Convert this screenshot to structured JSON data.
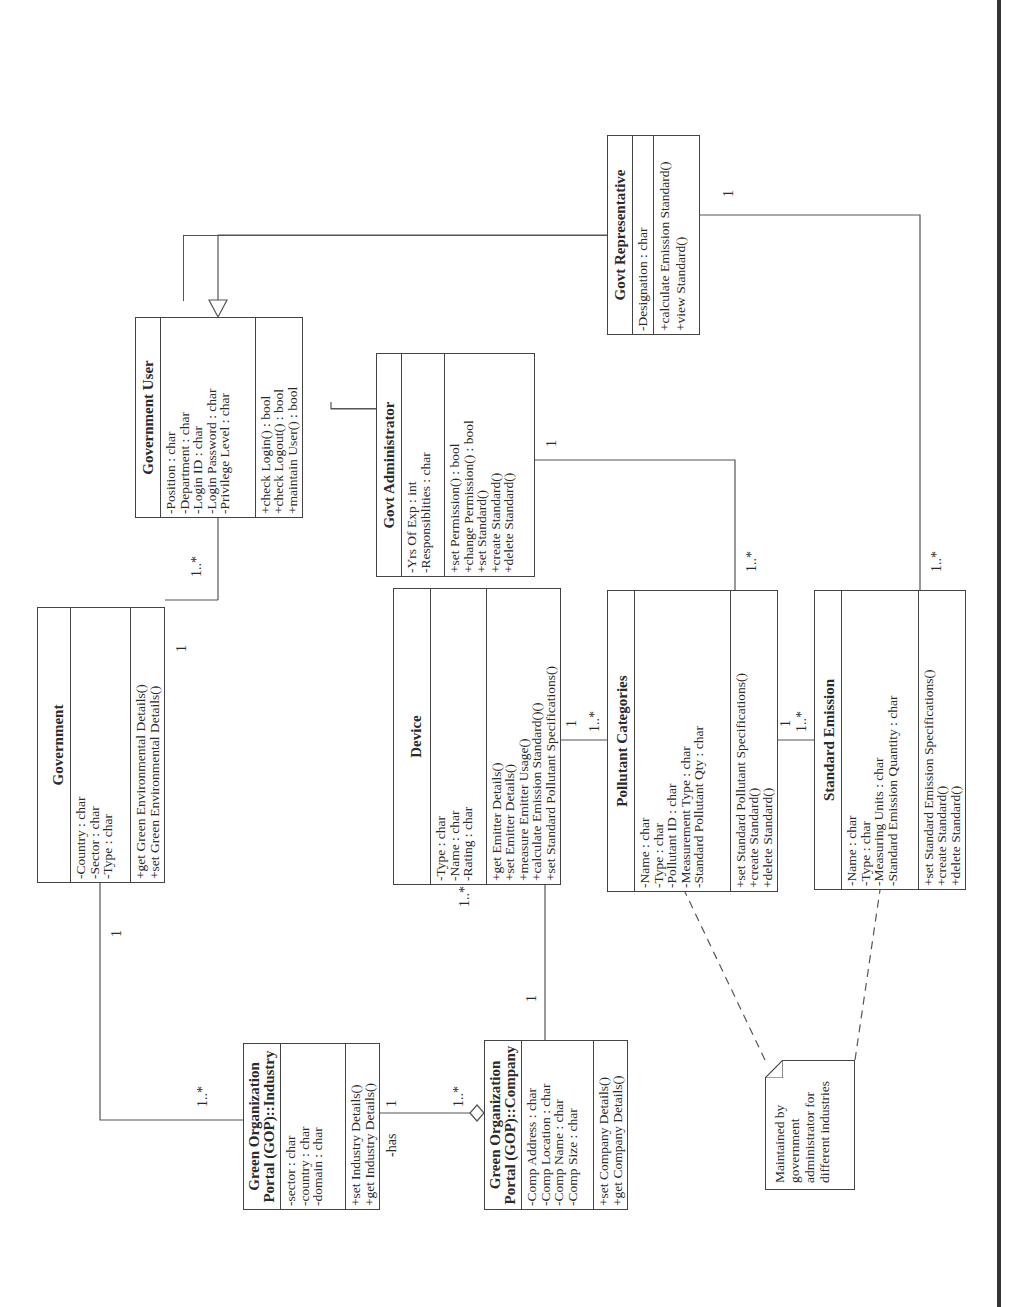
{
  "diagram_type": "UML class diagram",
  "orientation": "rotated 90 degrees counter-clockwise",
  "classes": {
    "government_user": {
      "name": "Government User",
      "attributes": [
        "-Position : char",
        "-Department : char",
        "-Login ID : char",
        "-Login Password : char",
        "-Privilege Level : char"
      ],
      "operations": [
        "+check Login() : bool",
        "+check Logout() : bool",
        "+maintain User() : bool"
      ]
    },
    "govt_administrator": {
      "name": "Govt Administrator",
      "attributes": [
        "-Yrs Of Exp : int",
        "-Responsiblities : char"
      ],
      "operations": [
        "+set Permission() : bool",
        "+change Permission() : bool",
        "+set Standard()",
        "+create Standard()",
        "+delete Standard()"
      ]
    },
    "govt_representative": {
      "name": "Govt Representative",
      "attributes": [
        "-Designation : char"
      ],
      "operations": [
        "+calculate Emission Standard()",
        "+view Standard()"
      ]
    },
    "government": {
      "name": "Government",
      "attributes": [
        "-Country : char",
        "-Sector : char",
        "-Type : char"
      ],
      "operations": [
        "+get Green Environmental Details()",
        "+set Green Environmental Details()"
      ]
    },
    "device": {
      "name": "Device",
      "attributes": [
        "-Type : char",
        "-Name : char",
        "-Rating : char"
      ],
      "operations": [
        "+get Emitter Details()",
        "+set Emitter Details()",
        "+measure Emitter Usage()",
        "+calculate Emission Standard()()",
        "+set Standard Pollutant Specifications()"
      ]
    },
    "pollutant_categories": {
      "name": "Pollutant Categories",
      "attributes": [
        "-Name : char",
        "-Type : char",
        "-Pollutant ID : char",
        "-Measurement Type : char",
        "-Standard Pollutant Qty : char"
      ],
      "operations": [
        "+set Standard Pollutant Specifications()",
        "+create Standard()",
        "+delete Standard()"
      ]
    },
    "standard_emission": {
      "name": "Standard Emission",
      "attributes": [
        "-Name : char",
        "-Type : char",
        "-Measuring Units : char",
        "-Standard Emission Quantity : char"
      ],
      "operations": [
        "+set Standard Emission Specifications()",
        "+create Standard()",
        "+delete Standard()"
      ]
    },
    "gop_industry": {
      "name_line1": "Green Organization",
      "name_line2": "Portal (GOP)::Industry",
      "attributes": [
        "-sector : char",
        "-country : char",
        "-domain : char"
      ],
      "operations": [
        "+set Industry Details()",
        "+get Industry Details()"
      ]
    },
    "gop_company": {
      "name_line1": "Green Organization",
      "name_line2": "Portal (GOP)::Company",
      "attributes": [
        "-Comp Address : char",
        "-Comp Location : char",
        "-Comp Name : char",
        "-Comp Size : char"
      ],
      "operations": [
        "+set Company Details()",
        "+get Company Details()"
      ]
    }
  },
  "note": {
    "line1": "Maintained by government",
    "line2": "administrator for",
    "line3": "different industries"
  },
  "multiplicities": {
    "government_to_user_gov": "1",
    "government_to_user_user": "1..*",
    "government_to_industry_gov": "1",
    "government_to_industry_ind": "1..*",
    "industry_company_ind": "1",
    "industry_company_comp": "1..*",
    "industry_company_role": "-has",
    "company_device_comp": "1",
    "company_device_dev": "1..*",
    "device_pollutant_dev": "1",
    "device_pollutant_pol": "1..*",
    "pollutant_emission_pol": "1",
    "pollutant_emission_em": "1..*",
    "admin_pollutant_admin": "1",
    "admin_pollutant_pol": "1..*",
    "rep_emission_rep": "1",
    "rep_emission_em": "1..*"
  },
  "colors": {
    "line": "#555555",
    "text": "#2a2a2a",
    "background": "#ffffff",
    "page_border": "#333333"
  }
}
